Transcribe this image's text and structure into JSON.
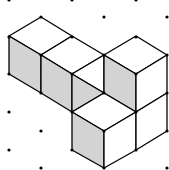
{
  "figure": {
    "type": "isometric-cube-drawing",
    "width": 169,
    "height": 170,
    "colors": {
      "background": "#ffffff",
      "shaded_face": "#d3d3d3",
      "light_face": "#ffffff",
      "line": "#000000",
      "dot": "#000000"
    },
    "grid": {
      "columns_x": [
        9,
        41,
        72,
        104,
        136,
        167
      ],
      "even_column_rows_y": [
        0,
        37,
        74,
        112,
        150
      ],
      "odd_column_rows_y": [
        17,
        55,
        93,
        131,
        168
      ],
      "dot_radius": 1.6
    },
    "faces": [
      {
        "name": "top-face-left-cube-1",
        "shade": "light",
        "points": "9,36 41,17 72,36 41,55"
      },
      {
        "name": "top-face-left-cube-2",
        "shade": "light",
        "points": "41,55 72,36 104,55 72,74"
      },
      {
        "name": "front-face-left-cube-1",
        "shade": "shaded",
        "points": "9,36 41,55 41,93 9,74"
      },
      {
        "name": "front-face-left-cube-2",
        "shade": "shaded",
        "points": "41,55 72,74 72,112 41,93"
      },
      {
        "name": "white-triangle-middle",
        "shade": "light",
        "points": "72,74 104,55 104,93"
      },
      {
        "name": "shaded-triangle-middle",
        "shade": "shaded",
        "points": "72,74 104,93 72,112"
      },
      {
        "name": "top-face-right-cube",
        "shade": "light",
        "points": "104,55 136,36 167,55 136,74"
      },
      {
        "name": "front-face-right-cube",
        "shade": "shaded",
        "points": "104,55 136,74 136,112 104,93"
      },
      {
        "name": "side-face-right-cube",
        "shade": "light",
        "points": "136,74 167,55 167,93 136,112"
      },
      {
        "name": "top-face-bottom-cube",
        "shade": "light",
        "points": "72,112 104,93 136,112 104,131"
      },
      {
        "name": "front-face-bottom-cube",
        "shade": "shaded",
        "points": "72,112 104,131 104,168 72,150"
      },
      {
        "name": "side-face-bottom-cube",
        "shade": "light",
        "points": "104,131 136,112 136,150 104,168"
      },
      {
        "name": "side-face-lower-right-cube",
        "shade": "light",
        "points": "136,112 167,93 167,131 136,150"
      }
    ]
  }
}
